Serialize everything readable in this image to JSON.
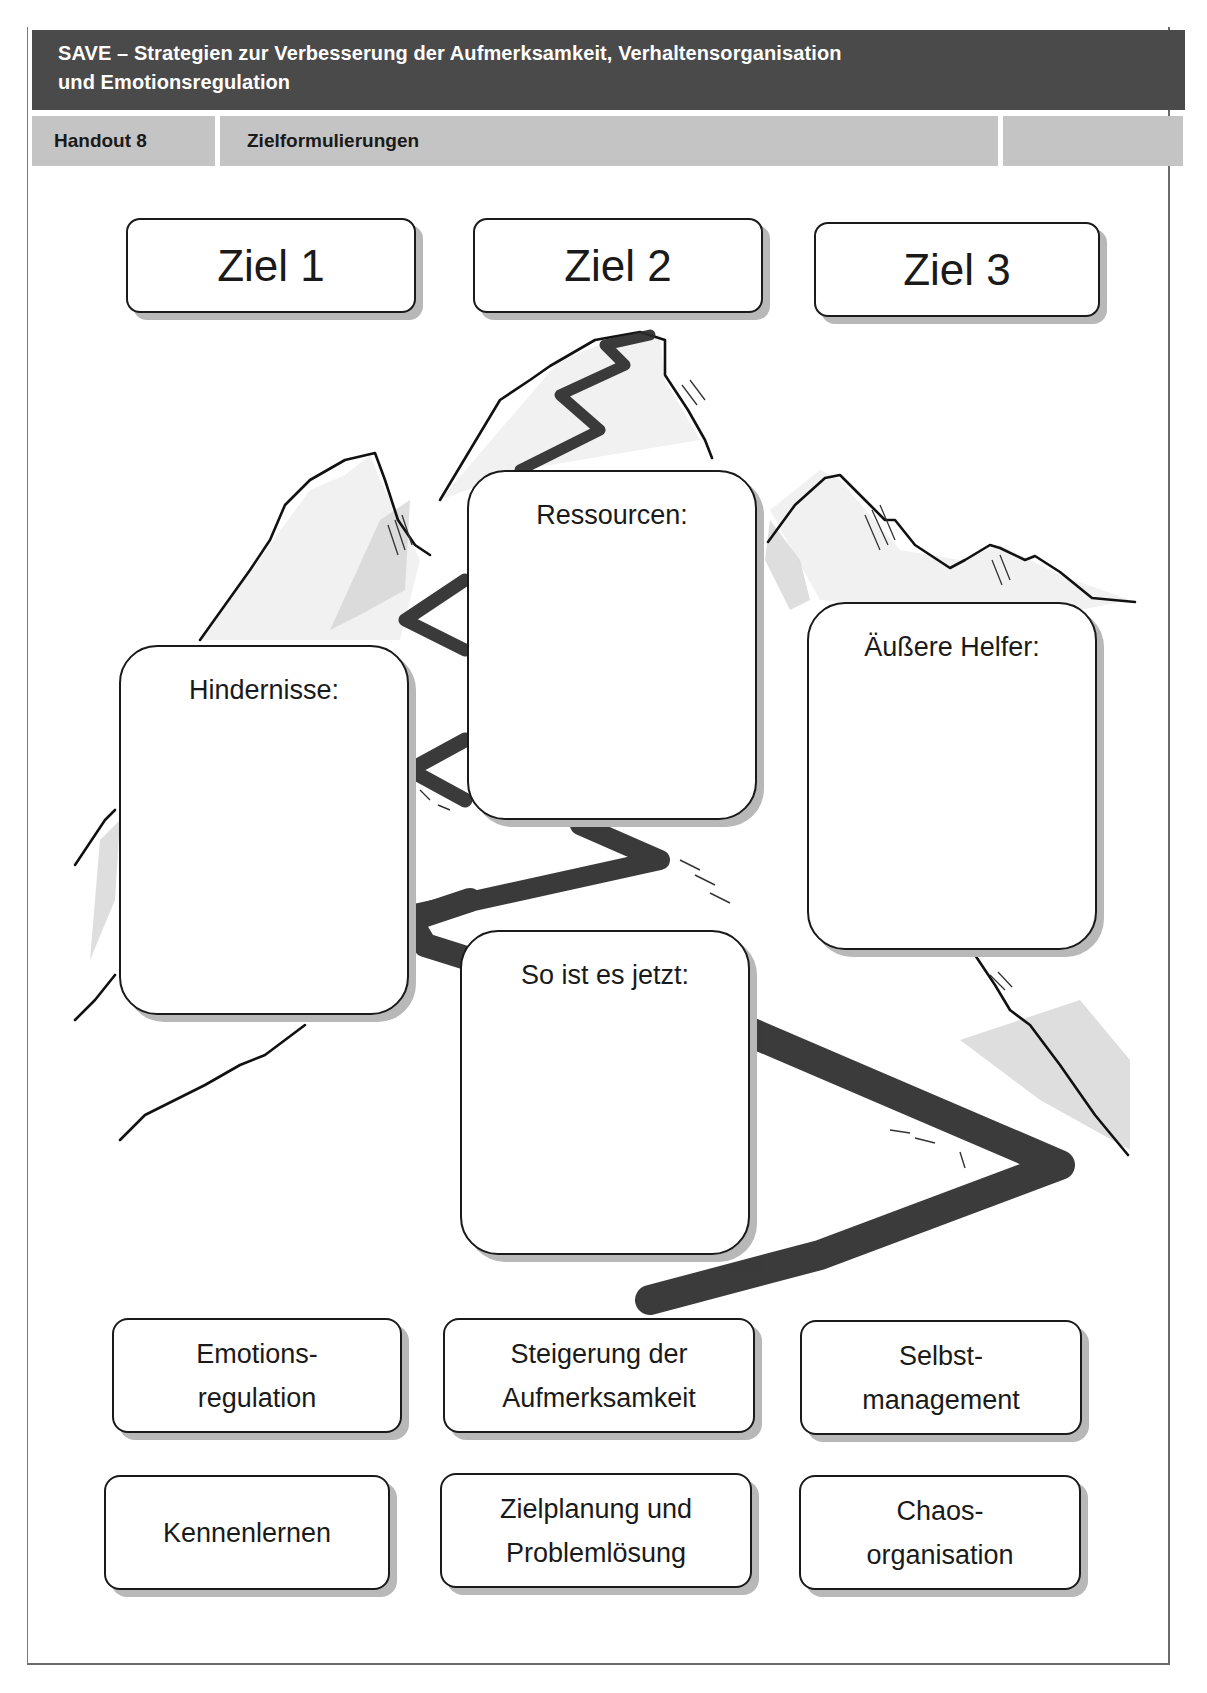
{
  "header": {
    "title_line1": "SAVE – Strategien zur Verbesserung der Aufmerksamkeit, Verhaltensorganisation",
    "title_line2": "und Emotionsregulation"
  },
  "subheader": {
    "handout_label": "Handout 8",
    "handout_title": "Zielformulierungen",
    "extra_cell": ""
  },
  "goals": [
    {
      "label": "Ziel 1"
    },
    {
      "label": "Ziel 2"
    },
    {
      "label": "Ziel 3"
    }
  ],
  "areas": {
    "resources": "Ressourcen:",
    "obstacles": "Hindernisse:",
    "external_helpers": "Äußere Helfer:",
    "current_state": "So ist es jetzt:"
  },
  "modules": [
    {
      "label": "Emotions-\nregulation"
    },
    {
      "label": "Steigerung der\nAufmerksamkeit"
    },
    {
      "label": "Selbst-\nmanagement"
    },
    {
      "label": "Kennenlernen"
    },
    {
      "label": "Zielplanung und\nProblemlösung"
    },
    {
      "label": "Chaos-\norganisation"
    }
  ],
  "colors": {
    "header_bg": "#4a4a4a",
    "subheader_bg": "#c4c4c4",
    "box_shadow": "#b8b8b8",
    "path": "#2a2a2a"
  }
}
